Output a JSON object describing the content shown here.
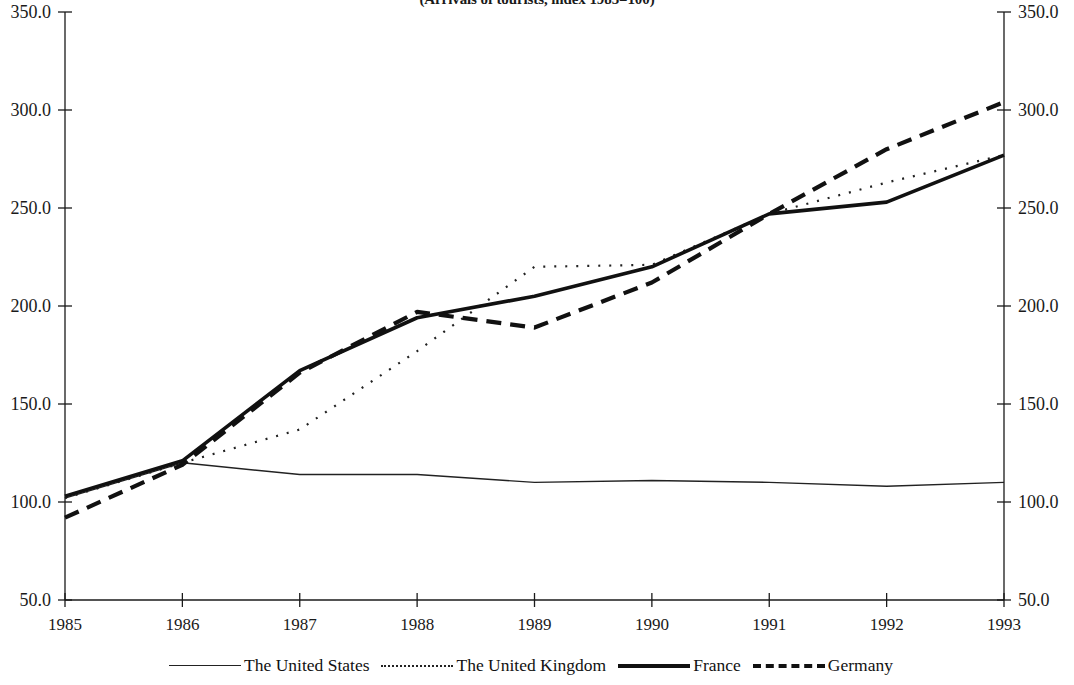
{
  "chart_data": {
    "type": "line",
    "title": "(Arrivals of tourists, index 1985=100)",
    "xlabel": "",
    "ylabel": "",
    "x": [
      1985,
      1986,
      1987,
      1988,
      1989,
      1990,
      1991,
      1992,
      1993
    ],
    "xtick_labels": [
      "1985",
      "1986",
      "1987",
      "1988",
      "1989",
      "1990",
      "1991",
      "1992",
      "1993"
    ],
    "xlim": [
      1985,
      1993
    ],
    "ylim": [
      50.0,
      350.0
    ],
    "ytick_labels": [
      "50.0",
      "100.0",
      "150.0",
      "200.0",
      "250.0",
      "300.0",
      "350.0"
    ],
    "ytick_values": [
      50.0,
      100.0,
      150.0,
      200.0,
      250.0,
      300.0,
      350.0
    ],
    "right_axis": true,
    "right_ytick_labels": [
      "50.0",
      "100.0",
      "150.0",
      "200.0",
      "250.0",
      "300.0",
      "350.0"
    ],
    "grid": false,
    "legend_position": "bottom",
    "series": [
      {
        "name": "The United States",
        "style": "thin-solid",
        "color": "#222222",
        "values": [
          102,
          120,
          114,
          114,
          110,
          111,
          110,
          108,
          110
        ]
      },
      {
        "name": "The United Kingdom",
        "style": "dotted",
        "color": "#222222",
        "values": [
          102,
          120,
          137,
          177,
          220,
          221,
          247,
          263,
          277
        ]
      },
      {
        "name": "France",
        "style": "thick-solid",
        "color": "#111111",
        "values": [
          103,
          121,
          167,
          194,
          205,
          220,
          247,
          253,
          277
        ]
      },
      {
        "name": "Germany",
        "style": "thick-dashed",
        "color": "#111111",
        "values": [
          92,
          119,
          166,
          197,
          189,
          212,
          247,
          280,
          304
        ]
      }
    ]
  },
  "legend": {
    "items": [
      {
        "label": "The United States"
      },
      {
        "label": "The United Kingdom"
      },
      {
        "label": "France"
      },
      {
        "label": "Germany"
      }
    ]
  }
}
